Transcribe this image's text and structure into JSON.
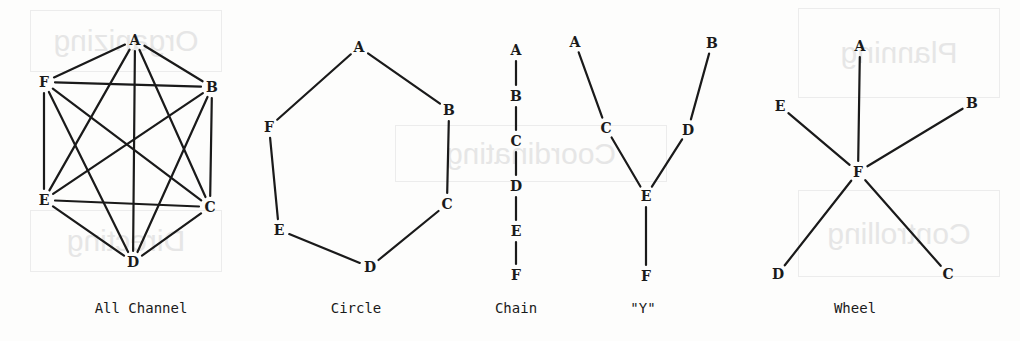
{
  "figure": {
    "colors": {
      "ink": "#1a1a1a",
      "paper": "#fdfdfc",
      "bleed_through": "#e6e6e6"
    },
    "bleed_through_text": [
      "Planning",
      "Organizing",
      "Coordinating",
      "Controlling",
      "Directing"
    ],
    "networks": [
      {
        "id": "all-channel",
        "caption": "All Channel",
        "caption_x": 141,
        "nodes": [
          {
            "label": "A",
            "x": 135,
            "y": 40
          },
          {
            "label": "B",
            "x": 212,
            "y": 87
          },
          {
            "label": "C",
            "x": 210,
            "y": 207
          },
          {
            "label": "D",
            "x": 133,
            "y": 262
          },
          {
            "label": "E",
            "x": 44,
            "y": 200
          },
          {
            "label": "F",
            "x": 44,
            "y": 82
          }
        ],
        "edges": [
          [
            "A",
            "B"
          ],
          [
            "A",
            "C"
          ],
          [
            "A",
            "D"
          ],
          [
            "A",
            "E"
          ],
          [
            "A",
            "F"
          ],
          [
            "B",
            "C"
          ],
          [
            "B",
            "D"
          ],
          [
            "B",
            "E"
          ],
          [
            "B",
            "F"
          ],
          [
            "C",
            "D"
          ],
          [
            "C",
            "E"
          ],
          [
            "C",
            "F"
          ],
          [
            "D",
            "E"
          ],
          [
            "D",
            "F"
          ],
          [
            "E",
            "F"
          ]
        ]
      },
      {
        "id": "circle",
        "caption": "Circle",
        "caption_x": 356,
        "nodes": [
          {
            "label": "A",
            "x": 359,
            "y": 47
          },
          {
            "label": "B",
            "x": 449,
            "y": 110
          },
          {
            "label": "C",
            "x": 447,
            "y": 204
          },
          {
            "label": "D",
            "x": 370,
            "y": 267
          },
          {
            "label": "E",
            "x": 279,
            "y": 230
          },
          {
            "label": "F",
            "x": 269,
            "y": 127
          }
        ],
        "edges": [
          [
            "A",
            "B"
          ],
          [
            "B",
            "C"
          ],
          [
            "C",
            "D"
          ],
          [
            "D",
            "E"
          ],
          [
            "E",
            "F"
          ],
          [
            "F",
            "A"
          ]
        ]
      },
      {
        "id": "chain",
        "caption": "Chain",
        "caption_x": 516,
        "nodes": [
          {
            "label": "A",
            "x": 516,
            "y": 50
          },
          {
            "label": "B",
            "x": 516,
            "y": 96
          },
          {
            "label": "C",
            "x": 516,
            "y": 141
          },
          {
            "label": "D",
            "x": 516,
            "y": 186
          },
          {
            "label": "E",
            "x": 516,
            "y": 231
          },
          {
            "label": "F",
            "x": 516,
            "y": 275
          }
        ],
        "edges": [
          [
            "A",
            "B"
          ],
          [
            "B",
            "C"
          ],
          [
            "C",
            "D"
          ],
          [
            "D",
            "E"
          ],
          [
            "E",
            "F"
          ]
        ]
      },
      {
        "id": "y",
        "caption": "\"Y\"",
        "caption_x": 643,
        "nodes": [
          {
            "label": "A",
            "x": 575,
            "y": 42
          },
          {
            "label": "B",
            "x": 712,
            "y": 43
          },
          {
            "label": "C",
            "x": 606,
            "y": 128
          },
          {
            "label": "D",
            "x": 688,
            "y": 130
          },
          {
            "label": "E",
            "x": 646,
            "y": 196
          },
          {
            "label": "F",
            "x": 646,
            "y": 276
          }
        ],
        "edges": [
          [
            "A",
            "C"
          ],
          [
            "C",
            "E"
          ],
          [
            "B",
            "D"
          ],
          [
            "D",
            "E"
          ],
          [
            "E",
            "F"
          ]
        ]
      },
      {
        "id": "wheel",
        "caption": "Wheel",
        "caption_x": 855,
        "nodes": [
          {
            "label": "A",
            "x": 860,
            "y": 46
          },
          {
            "label": "B",
            "x": 972,
            "y": 103
          },
          {
            "label": "C",
            "x": 948,
            "y": 274
          },
          {
            "label": "D",
            "x": 778,
            "y": 274
          },
          {
            "label": "E",
            "x": 780,
            "y": 106
          },
          {
            "label": "F",
            "x": 858,
            "y": 172
          }
        ],
        "edges": [
          [
            "F",
            "A"
          ],
          [
            "F",
            "B"
          ],
          [
            "F",
            "C"
          ],
          [
            "F",
            "D"
          ],
          [
            "F",
            "E"
          ]
        ]
      }
    ]
  }
}
